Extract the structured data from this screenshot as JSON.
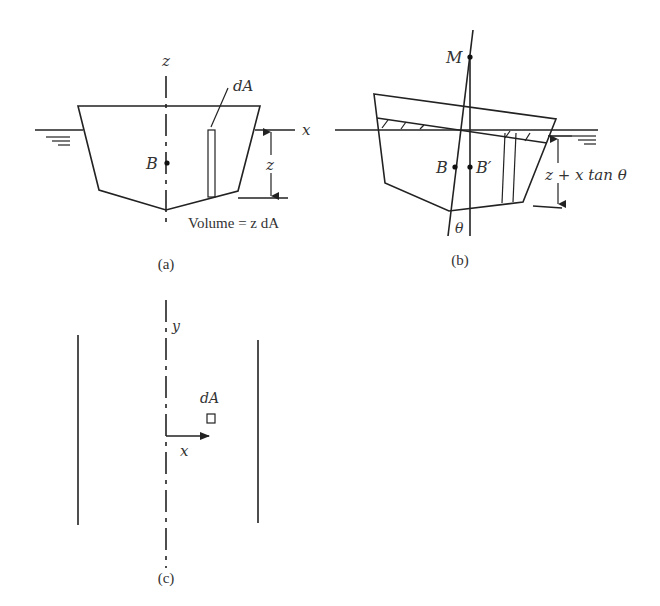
{
  "figure": {
    "panels": [
      {
        "id": "a",
        "caption": "(a)",
        "labels": {
          "z_axis": "z",
          "x_axis": "x",
          "center_of_buoyancy": "B",
          "element_area": "dA",
          "depth": "z",
          "volume_formula": "Volume = z dA"
        }
      },
      {
        "id": "b",
        "caption": "(b)",
        "labels": {
          "metacenter": "M",
          "center_of_buoyancy": "B",
          "shifted_center": "B′",
          "angle": "θ",
          "depth": "z + x tan θ"
        }
      },
      {
        "id": "c",
        "caption": "(c)",
        "labels": {
          "y_axis": "y",
          "x_axis": "x",
          "element_area": "dA"
        }
      }
    ]
  }
}
